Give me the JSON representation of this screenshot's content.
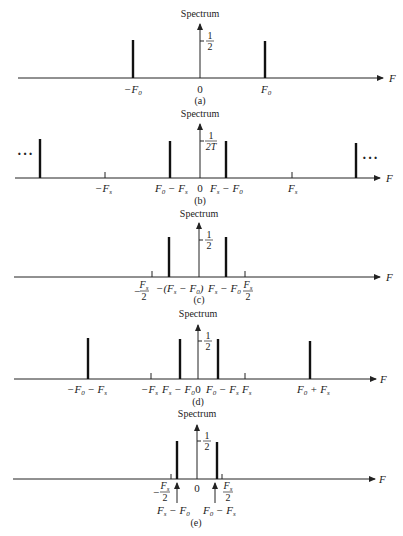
{
  "figure": {
    "axis_label": "F",
    "panels": [
      {
        "id": "a",
        "caption": "(a)",
        "title": "Spectrum",
        "amplitude_label_num": "1",
        "amplitude_label_den": "2",
        "labels": {
          "left": "−F",
          "left_sub": "0",
          "center": "0",
          "right": "F",
          "right_sub": "0"
        }
      },
      {
        "id": "b",
        "caption": "(b)",
        "title": "Spectrum",
        "amplitude_label_num": "1",
        "amplitude_label_den": "2T",
        "ellipsis": "···",
        "labels": {
          "neg_fs": "−F",
          "neg_fs_sub": "s",
          "f0_minus_fs": "F",
          "f0_minus_fs_rest": " − F",
          "center": "0",
          "fs_minus_f0": "F",
          "fs_minus_f0_rest": " − F",
          "fs": "F",
          "fs_sub": "s"
        }
      },
      {
        "id": "c",
        "caption": "(c)",
        "title": "Spectrum",
        "amplitude_label_num": "1",
        "amplitude_label_den": "2",
        "labels": {
          "neg_half_fs_num": "F",
          "neg_half_fs_den": "2",
          "neg_alias": "−(F",
          "neg_alias_mid": " − F",
          "neg_alias_end": ")",
          "pos_alias": "F",
          "pos_alias_rest": " − F",
          "half_fs_num": "F",
          "half_fs_den": "2"
        }
      },
      {
        "id": "d",
        "caption": "(d)",
        "title": "Spectrum",
        "amplitude_label_num": "1",
        "amplitude_label_den": "2",
        "labels": {
          "neg_f0_minus_fs": "−F",
          "neg_f0_minus_fs_rest": " − F",
          "neg_fs": "−F",
          "fs_minus_f0": "F",
          "fs_minus_f0_rest": " − F",
          "center": "0",
          "f0_minus_fs": "F",
          "f0_minus_fs_rest": " − F",
          "fs": "F",
          "f0_plus_fs": "F",
          "f0_plus_fs_rest": " + F"
        }
      },
      {
        "id": "e",
        "caption": "(e)",
        "title": "Spectrum",
        "amplitude_label_num": "1",
        "amplitude_label_den": "2",
        "labels": {
          "neg_half_fs_num": "F",
          "neg_half_fs_den": "2",
          "center": "0",
          "half_fs_num": "F",
          "half_fs_den": "2",
          "fs_minus_f0": "F",
          "fs_minus_f0_rest": " − F",
          "f0_minus_fs": "F",
          "f0_minus_fs_rest": " − F"
        }
      }
    ],
    "subscripts": {
      "zero": "0",
      "s": "s"
    }
  }
}
